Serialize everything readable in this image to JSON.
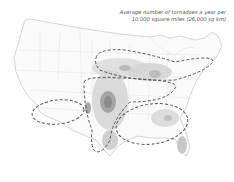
{
  "caption": {
    "line1": "Average number of tornadoes a year per",
    "line2": "10,000 square miles (26,000 sq km)"
  },
  "colors": {
    "outline": "#b8b8b8",
    "state_lines": "#d0d0d0",
    "density_light": "#dcdcdc",
    "density_mid": "#b5b5b5",
    "density_dark": "#8a8a8a",
    "dashed_ellipse": "#555555"
  },
  "regions": [
    {
      "name": "northern-plains-great-lakes-region"
    },
    {
      "name": "tornado-alley-region"
    },
    {
      "name": "southwest-region"
    },
    {
      "name": "dixie-alley-region"
    }
  ]
}
